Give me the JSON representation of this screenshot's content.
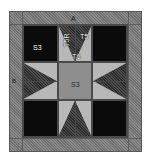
{
  "diagram": {
    "labels": {
      "border_top": "A",
      "border_left": "B",
      "corner_square": "S3",
      "center_square": "S3",
      "point_right": "T5",
      "point_left": "T5R",
      "point_center": "T6"
    },
    "colors": {
      "border_fabric": "#7d7d7d",
      "corner_fabric": "#0b0b0b",
      "background_fabric": "#b8b8b8",
      "center_fabric": "#8e8e8e",
      "star_point_fabric": "#3a3a3a",
      "seam_line": "#4a4a4a",
      "page_background": "#ffffff"
    },
    "pieces": [
      {
        "code": "A",
        "role": "top and bottom border strip"
      },
      {
        "code": "B",
        "role": "left and right border strip"
      },
      {
        "code": "S3",
        "role": "corner square and center square"
      },
      {
        "code": "T5",
        "role": "background star point triangle"
      },
      {
        "code": "T5R",
        "role": "reversed background star point triangle"
      },
      {
        "code": "T6",
        "role": "star point triangle"
      }
    ]
  }
}
